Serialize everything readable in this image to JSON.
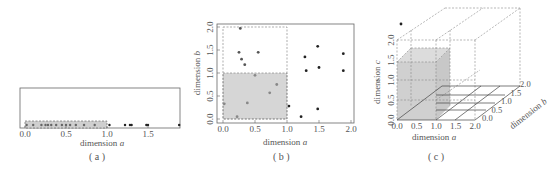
{
  "figure": {
    "panels": [
      {
        "id": "a",
        "caption": "( a )"
      },
      {
        "id": "b",
        "caption": "( b )"
      },
      {
        "id": "c",
        "caption": "( c )"
      }
    ]
  },
  "chart_data": [
    {
      "type": "scatter",
      "title": "",
      "caption": "( a )",
      "xlabel": "dimension a",
      "ylabel": "",
      "xlim": [
        0.0,
        2.0
      ],
      "xticks": [
        "0.0",
        "0.5",
        "1.0",
        "1.5"
      ],
      "highlight_region": {
        "x": [
          0.0,
          1.0
        ]
      },
      "points_x": [
        0.02,
        0.1,
        0.2,
        0.25,
        0.28,
        0.32,
        0.38,
        0.45,
        0.5,
        0.55,
        0.62,
        0.72,
        0.85,
        1.03,
        1.22,
        1.28,
        1.3,
        1.48,
        1.5,
        1.88
      ]
    },
    {
      "type": "scatter",
      "title": "",
      "caption": "( b )",
      "xlabel": "dimension a",
      "ylabel": "dimension b",
      "xlim": [
        0.0,
        2.0
      ],
      "ylim": [
        0.0,
        2.0
      ],
      "xticks": [
        "0.0",
        "0.5",
        "1.0",
        "1.5",
        "2.0"
      ],
      "yticks": [
        "0.0",
        "0.5",
        "1.0",
        "1.5",
        "2.0"
      ],
      "highlight_region": {
        "x": [
          0.0,
          1.0
        ],
        "y": [
          0.0,
          1.0
        ]
      },
      "dashed_region": {
        "x": [
          0.0,
          1.0
        ],
        "y": [
          0.0,
          2.0
        ]
      },
      "points": [
        {
          "a": 0.27,
          "b": 1.97
        },
        {
          "a": 0.25,
          "b": 1.45
        },
        {
          "a": 0.55,
          "b": 1.45
        },
        {
          "a": 0.29,
          "b": 1.3
        },
        {
          "a": 0.34,
          "b": 1.18
        },
        {
          "a": 0.5,
          "b": 0.95
        },
        {
          "a": 0.84,
          "b": 0.75
        },
        {
          "a": 0.73,
          "b": 0.57
        },
        {
          "a": 0.02,
          "b": 0.33
        },
        {
          "a": 0.38,
          "b": 0.35
        },
        {
          "a": 0.22,
          "b": 0.05
        },
        {
          "a": 1.03,
          "b": 0.28
        },
        {
          "a": 1.22,
          "b": 0.05
        },
        {
          "a": 1.48,
          "b": 0.22
        },
        {
          "a": 1.28,
          "b": 1.35
        },
        {
          "a": 1.3,
          "b": 1.05
        },
        {
          "a": 1.48,
          "b": 1.58
        },
        {
          "a": 1.5,
          "b": 1.12
        },
        {
          "a": 1.88,
          "b": 1.42
        },
        {
          "a": 1.88,
          "b": 1.05
        }
      ]
    },
    {
      "type": "scatter",
      "title": "",
      "caption": "( c )",
      "xlabel": "dimension a",
      "ylabel": "dimension b",
      "zlabel": "dimension c",
      "xlim": [
        0.0,
        2.0
      ],
      "ylim": [
        0.0,
        2.0
      ],
      "zlim": [
        0.0,
        2.0
      ],
      "xticks": [
        "0.0",
        "0.5",
        "1.0",
        "1.5",
        "2.0"
      ],
      "yticks": [
        "0.0",
        "0.5",
        "1.0",
        "1.5",
        "2.0"
      ],
      "zticks": [
        "0.0",
        "0.5",
        "1.0",
        "1.5",
        "2.0"
      ],
      "highlight_region": {
        "a": [
          0.0,
          1.0
        ],
        "b": [
          0.0,
          1.0
        ],
        "c": [
          0.0,
          1.0
        ]
      },
      "points_projected_px": [
        [
          103,
          99
        ],
        [
          117,
          71
        ],
        [
          147,
          75
        ],
        [
          176,
          77
        ],
        [
          170,
          63
        ],
        [
          178,
          60
        ],
        [
          175,
          81
        ],
        [
          200,
          74
        ],
        [
          208,
          79
        ],
        [
          205,
          85
        ],
        [
          233,
          88
        ],
        [
          198,
          22
        ],
        [
          202,
          24
        ],
        [
          221,
          54
        ],
        [
          245,
          41
        ],
        [
          268,
          67
        ],
        [
          263,
          43
        ],
        [
          325,
          75
        ],
        [
          363,
          42
        ],
        [
          401,
          24
        ],
        [
          378,
          81
        ],
        [
          338,
          87
        ],
        [
          271,
          109
        ],
        [
          262,
          117
        ]
      ]
    }
  ]
}
